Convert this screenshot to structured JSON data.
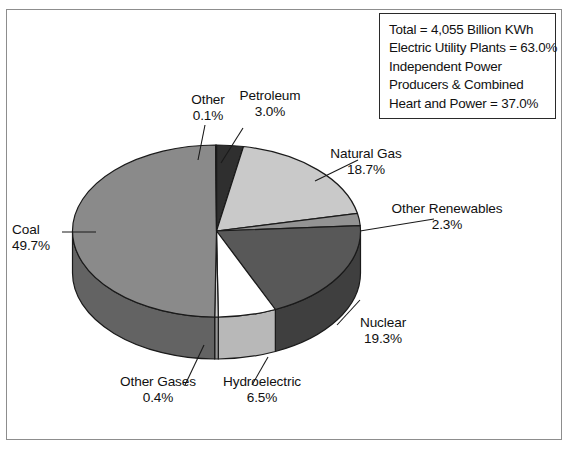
{
  "chart_data": {
    "type": "pie",
    "title": "",
    "unit": "%",
    "total_label": "Total = 4,055 Billion KWh",
    "categories": [
      "Petroleum",
      "Natural Gas",
      "Other Renewables",
      "Nuclear",
      "Hydroelectric",
      "Other Gases",
      "Coal",
      "Other"
    ],
    "values": [
      3.0,
      18.7,
      2.3,
      19.3,
      6.5,
      0.4,
      49.7,
      0.1
    ],
    "labels": [
      {
        "name": "Other",
        "value": "0.1%",
        "color": "#2f2f2f"
      },
      {
        "name": "Petroleum",
        "value": "3.0%",
        "color": "#c9c9c9"
      },
      {
        "name": "Natural Gas",
        "value": "18.7%",
        "color": "#939393"
      },
      {
        "name": "Other Renewables",
        "value": "2.3%",
        "color": "#585858"
      },
      {
        "name": "Nuclear",
        "value": "19.3%",
        "color": "#ffffff"
      },
      {
        "name": "Hydroelectric",
        "value": "6.5%",
        "color": "#cfcfcf"
      },
      {
        "name": "Other Gases",
        "value": "0.4%",
        "color": "#8a8a8a"
      },
      {
        "name": "Coal",
        "value": "49.7%",
        "color": "#2f2f2f"
      }
    ],
    "legend_position": "top-right",
    "grid": false
  },
  "legend": {
    "lines": [
      "Total = 4,055 Billion KWh",
      "Electric Utility Plants = 63.0%",
      "Independent Power",
      "Producers & Combined",
      "Heart and Power = 37.0%"
    ]
  },
  "callouts": {
    "other": {
      "name": "Other",
      "value": "0.1%"
    },
    "petroleum": {
      "name": "Petroleum",
      "value": "3.0%"
    },
    "natural_gas": {
      "name": "Natural Gas",
      "value": "18.7%"
    },
    "renewables": {
      "name": "Other Renewables",
      "value": "2.3%"
    },
    "nuclear": {
      "name": "Nuclear",
      "value": "19.3%"
    },
    "hydro": {
      "name": "Hydroelectric",
      "value": "6.5%"
    },
    "other_gases": {
      "name": "Other Gases",
      "value": "0.4%"
    },
    "coal": {
      "name": "Coal",
      "value": "49.7%"
    }
  },
  "colors": {
    "frame_border": "#8d8d8d",
    "legend_border": "#2a2a2a",
    "coal": "#2f2f2f",
    "natural_gas": "#939393",
    "petroleum": "#c9c9c9",
    "nuclear": "#ffffff",
    "hydroelectric": "#cfcfcf",
    "other_gases": "#8a8a8a",
    "other_renewables": "#585858",
    "leader_line": "#1a1a1a"
  }
}
